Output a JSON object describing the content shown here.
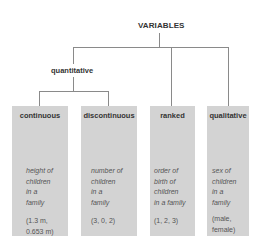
{
  "diagram": {
    "root": "VARIABLES",
    "group": "quantitative",
    "categories": [
      {
        "label": "continuous",
        "description": "height of\nchildren\nin a\nfamily",
        "example": "(1.3 m,\n0.653 m)"
      },
      {
        "label": "discontinuous",
        "description": "number of\nchildren\nin a\nfamily",
        "example": "(3, 0, 2)"
      },
      {
        "label": "ranked",
        "description": "order of\nbirth of\nchildren\nin a family",
        "example": "(1, 2, 3)"
      },
      {
        "label": "qualitative",
        "description": "sex of\nchildren\nin a\nfamily",
        "example": "(male,\nfemale)"
      }
    ],
    "colors": {
      "box": "#d3d3d3",
      "line": "#8a8a8a",
      "text": "#333333"
    }
  }
}
